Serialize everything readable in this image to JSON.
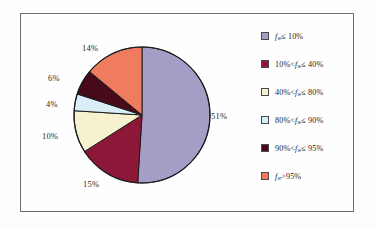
{
  "figure": {
    "border_color": "#6e6e6e",
    "background": "#fefefe"
  },
  "chart_data": {
    "type": "pie",
    "title": "",
    "subtitle": "",
    "xlabel": "",
    "ylabel": "",
    "legend_position": "right",
    "grid": false,
    "start_angle_deg": 0,
    "direction": "clockwise",
    "categories": [
      "f_w ≤ 10%",
      "10% < f_w ≤ 40%",
      "40% < f_w ≤ 80%",
      "80% < f_w ≤ 90%",
      "90% < f_w ≤ 95%",
      "f_w > 95%"
    ],
    "values": [
      51,
      15,
      10,
      4,
      6,
      14
    ],
    "value_labels": [
      "51%",
      "15%",
      "10%",
      "4%",
      "6%",
      "14%"
    ],
    "colors": [
      "#a59dc6",
      "#8d1739",
      "#f6f2cf",
      "#d9eef6",
      "#470a1b",
      "#f07c60"
    ],
    "slice_outline_color": "#1c1c1c"
  },
  "slices": [
    {
      "key": "f-le-10",
      "label_html": "<i>f</i><sub>w</sub>≤ 10%",
      "prefix": "",
      "percent_label": "51%",
      "value": 51,
      "color": "#a59dc6"
    },
    {
      "key": "10-to-40",
      "label_html": "10%<<i>f</i><sub>w</sub>≤ 40%",
      "prefix": "10%<",
      "percent_label": "15%",
      "value": 15,
      "color": "#8d1739"
    },
    {
      "key": "40-to-80",
      "label_html": "40%<<i>f</i><sub>w</sub>≤ 80%",
      "prefix": "40%<",
      "percent_label": "10%",
      "value": 10,
      "color": "#f6f2cf"
    },
    {
      "key": "80-to-90",
      "label_html": "80%<<i>f</i><sub>w</sub>≤ 90%",
      "prefix": "80%<",
      "percent_label": "4%",
      "value": 4,
      "color": "#d9eef6"
    },
    {
      "key": "90-to-95",
      "label_html": "90%<<i>f</i><sub>w</sub>≤ 95%",
      "prefix": "90%<",
      "percent_label": "6%",
      "value": 6,
      "color": "#470a1b"
    },
    {
      "key": "gt-95",
      "label_html": "<i>f</i><sub>w</sub>>95%",
      "prefix": "",
      "percent_label": "14%",
      "value": 14,
      "color": "#f07c60"
    }
  ],
  "legend": {
    "items": [
      {
        "label": "fₑ≤10%",
        "color": "#a59dc6"
      },
      {
        "label": "10%<fₑ≤40%",
        "color": "#8d1739"
      },
      {
        "label": "40%<fₑ≤80%",
        "color": "#f6f2cf"
      },
      {
        "label": "80%<fₑ≤90%",
        "color": "#d9eef6"
      },
      {
        "label": "90%<fₑ≤95%",
        "color": "#470a1b"
      },
      {
        "label": "fₑ>95%",
        "color": "#f07c60"
      }
    ]
  },
  "percent_labels": {
    "p51": "51%",
    "p15": "15%",
    "p10": "10%",
    "p4": "4%",
    "p6": "6%",
    "p14": "14%"
  }
}
